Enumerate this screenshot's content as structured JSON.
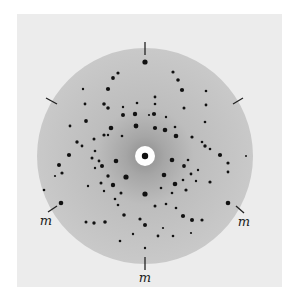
{
  "figure": {
    "type": "Laue X-ray diffraction photograph",
    "colors": {
      "page": "#ffffff",
      "plate": "#ececec",
      "disc": "#c6c6c6",
      "disc_halo": "#a9a9a9",
      "spot": "#111111",
      "center_hole": "#ffffff",
      "tick": "#222222"
    },
    "disc": {
      "cx": 145,
      "cy": 156,
      "r": 108
    },
    "center": {
      "hole_r": 10,
      "beam_r": 3.2
    },
    "ticks": [
      {
        "name": "tick-top",
        "x1": 145,
        "y1": 42,
        "x2": 145,
        "y2": 55
      },
      {
        "name": "tick-upper-left",
        "x1": 46,
        "y1": 98,
        "x2": 57,
        "y2": 104
      },
      {
        "name": "tick-upper-right",
        "x1": 233,
        "y1": 104,
        "x2": 243,
        "y2": 98
      },
      {
        "name": "tick-lower-left",
        "x1": 48,
        "y1": 212,
        "x2": 57,
        "y2": 206
      },
      {
        "name": "tick-lower-right",
        "x1": 236,
        "y1": 206,
        "x2": 244,
        "y2": 213
      },
      {
        "name": "tick-bottom",
        "x1": 145,
        "y1": 257,
        "x2": 145,
        "y2": 270
      }
    ],
    "labels": [
      {
        "text": "m",
        "x": 46,
        "y": 220
      },
      {
        "text": "m",
        "x": 244,
        "y": 221
      },
      {
        "text": "m",
        "x": 145,
        "y": 277
      }
    ],
    "spots": [
      [
        145,
        62,
        2.6
      ],
      [
        118,
        73,
        1.6
      ],
      [
        113,
        78,
        1.9
      ],
      [
        108,
        89,
        2.1
      ],
      [
        83,
        89,
        1.2
      ],
      [
        104,
        104,
        1.8
      ],
      [
        85,
        104,
        1.4
      ],
      [
        108,
        108,
        1.8
      ],
      [
        123,
        107,
        1.2
      ],
      [
        137,
        103,
        1.3
      ],
      [
        123,
        115,
        2.0
      ],
      [
        135,
        114,
        2.2
      ],
      [
        136,
        126,
        2.4
      ],
      [
        86,
        121,
        1.9
      ],
      [
        70,
        126,
        1.4
      ],
      [
        111,
        128,
        2.3
      ],
      [
        104,
        135,
        1.6
      ],
      [
        122,
        136,
        1.3
      ],
      [
        94,
        139,
        1.5
      ],
      [
        82,
        146,
        1.4
      ],
      [
        77,
        142,
        1.7
      ],
      [
        95,
        151,
        1.3
      ],
      [
        108,
        135,
        1.2
      ],
      [
        173,
        72,
        1.6
      ],
      [
        178,
        80,
        1.8
      ],
      [
        182,
        90,
        2.1
      ],
      [
        206,
        91,
        1.3
      ],
      [
        155,
        97,
        1.4
      ],
      [
        155,
        104,
        1.3
      ],
      [
        184,
        108,
        1.5
      ],
      [
        206,
        105,
        1.4
      ],
      [
        154,
        114,
        2.1
      ],
      [
        166,
        117,
        1.2
      ],
      [
        149,
        115,
        1.1
      ],
      [
        175,
        127,
        1.3
      ],
      [
        165,
        130,
        2.3
      ],
      [
        155,
        128,
        2.1
      ],
      [
        205,
        122,
        1.3
      ],
      [
        176,
        136,
        2.3
      ],
      [
        192,
        137,
        1.6
      ],
      [
        202,
        142,
        1.3
      ],
      [
        205,
        146,
        1.7
      ],
      [
        210,
        149,
        1.3
      ],
      [
        220,
        155,
        2.1
      ],
      [
        69,
        155,
        2.1
      ],
      [
        59,
        165,
        2.0
      ],
      [
        62,
        173,
        1.6
      ],
      [
        55,
        176,
        1.1
      ],
      [
        44,
        190,
        1.3
      ],
      [
        61,
        203,
        2.3
      ],
      [
        92,
        158,
        1.5
      ],
      [
        99,
        161,
        1.4
      ],
      [
        116,
        161,
        2.3
      ],
      [
        102,
        166,
        2.0
      ],
      [
        95,
        168,
        1.2
      ],
      [
        108,
        176,
        1.7
      ],
      [
        126,
        177,
        2.6
      ],
      [
        113,
        185,
        2.2
      ],
      [
        101,
        183,
        1.5
      ],
      [
        88,
        186,
        1.2
      ],
      [
        121,
        193,
        1.5
      ],
      [
        115,
        199,
        1.3
      ],
      [
        145,
        194,
        2.6
      ],
      [
        104,
        191,
        1.2
      ],
      [
        118,
        205,
        1.3
      ],
      [
        124,
        215,
        1.8
      ],
      [
        140,
        219,
        1.6
      ],
      [
        86,
        222,
        1.5
      ],
      [
        94,
        223,
        1.7
      ],
      [
        105,
        222,
        1.8
      ],
      [
        145,
        225,
        2.0
      ],
      [
        133,
        234,
        1.2
      ],
      [
        158,
        236,
        1.4
      ],
      [
        120,
        241,
        1.3
      ],
      [
        145,
        248,
        1.2
      ],
      [
        172,
        160,
        2.3
      ],
      [
        184,
        166,
        1.9
      ],
      [
        188,
        160,
        1.3
      ],
      [
        191,
        174,
        1.4
      ],
      [
        198,
        170,
        1.2
      ],
      [
        164,
        175,
        2.3
      ],
      [
        175,
        184,
        2.3
      ],
      [
        183,
        180,
        1.3
      ],
      [
        196,
        181,
        1.2
      ],
      [
        161,
        188,
        1.3
      ],
      [
        172,
        193,
        1.3
      ],
      [
        186,
        190,
        1.6
      ],
      [
        166,
        204,
        1.3
      ],
      [
        176,
        208,
        1.3
      ],
      [
        183,
        216,
        2.1
      ],
      [
        192,
        220,
        2.0
      ],
      [
        202,
        220,
        1.6
      ],
      [
        210,
        182,
        1.6
      ],
      [
        228,
        163,
        1.6
      ],
      [
        228,
        172,
        1.4
      ],
      [
        228,
        203,
        2.3
      ],
      [
        155,
        206,
        1.5
      ],
      [
        173,
        236,
        1.3
      ],
      [
        163,
        228,
        1.1
      ],
      [
        191,
        233,
        1.1
      ],
      [
        246,
        156,
        1.0
      ]
    ]
  }
}
